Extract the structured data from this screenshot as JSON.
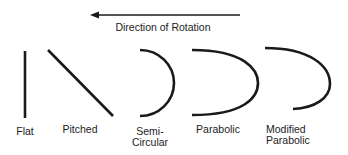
{
  "title": "Direction of Rotation",
  "arrow": {
    "direction": "left"
  },
  "blades": [
    {
      "id": "flat",
      "label": "Flat",
      "shape": "straight-vertical"
    },
    {
      "id": "pitched",
      "label": "Pitched",
      "shape": "straight-diagonal"
    },
    {
      "id": "semi-circular",
      "label_line1": "Semi-",
      "label_line2": "Circular",
      "shape": "semicircle"
    },
    {
      "id": "parabolic",
      "label": "Parabolic",
      "shape": "parabola"
    },
    {
      "id": "modified-parabolic",
      "label_line1": "Modified",
      "label_line2": "Parabolic",
      "shape": "modified-parabola"
    }
  ],
  "colors": {
    "stroke": "#1a1a1a",
    "background": "#ffffff"
  }
}
